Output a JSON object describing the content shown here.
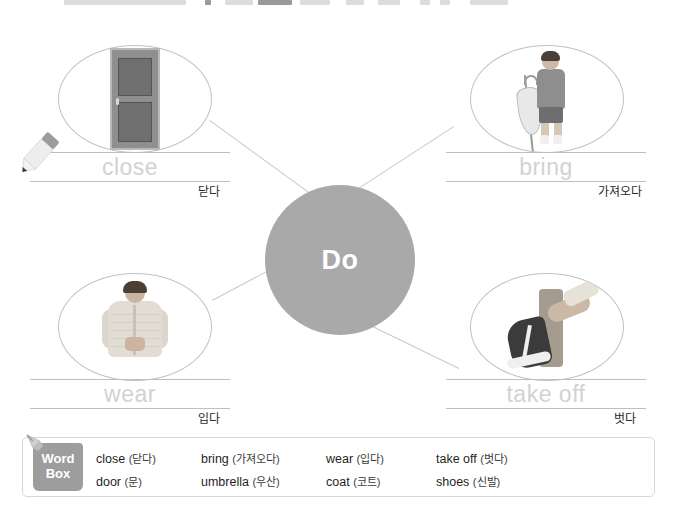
{
  "page": {
    "center_node": "Do",
    "header_sliver_visible": true
  },
  "colors": {
    "center_circle": "#a9a9a9",
    "ghost_text": "#d2d2d2",
    "rule_line": "#bfbfbf",
    "ellipse_border": "#c2c2c2",
    "wordbox_tab": "#9d9d9d",
    "connector": "#c9c9c9"
  },
  "branches": [
    {
      "id": "close",
      "position": "top-left",
      "answer_ghost": "close",
      "korean": "닫다",
      "image_name": "door-photo",
      "image_alt": "wooden door"
    },
    {
      "id": "bring",
      "position": "top-right",
      "answer_ghost": "bring",
      "korean": "가져오다",
      "image_name": "umbrella-photo",
      "image_alt": "child holding an umbrella"
    },
    {
      "id": "wear",
      "position": "bottom-left",
      "answer_ghost": "wear",
      "korean": "입다",
      "image_name": "coat-photo",
      "image_alt": "child zipping a padded coat"
    },
    {
      "id": "take-off",
      "position": "bottom-right",
      "answer_ghost": "take off",
      "korean": "벗다",
      "image_name": "shoes-photo",
      "image_alt": "person taking off a sneaker"
    }
  ],
  "word_box": {
    "tab_line1": "Word",
    "tab_line2": "Box",
    "pin_icon": "pushpin-icon",
    "rows": [
      [
        {
          "en": "close",
          "ko": "(닫다)"
        },
        {
          "en": "bring",
          "ko": "(가져오다)"
        },
        {
          "en": "wear",
          "ko": "(입다)"
        },
        {
          "en": "take off",
          "ko": "(벗다)"
        }
      ],
      [
        {
          "en": "door",
          "ko": "(문)"
        },
        {
          "en": "umbrella",
          "ko": "(우산)"
        },
        {
          "en": "coat",
          "ko": "(코트)"
        },
        {
          "en": "shoes",
          "ko": "(신발)"
        }
      ]
    ]
  },
  "pencil": {
    "icon": "pencil-icon"
  }
}
